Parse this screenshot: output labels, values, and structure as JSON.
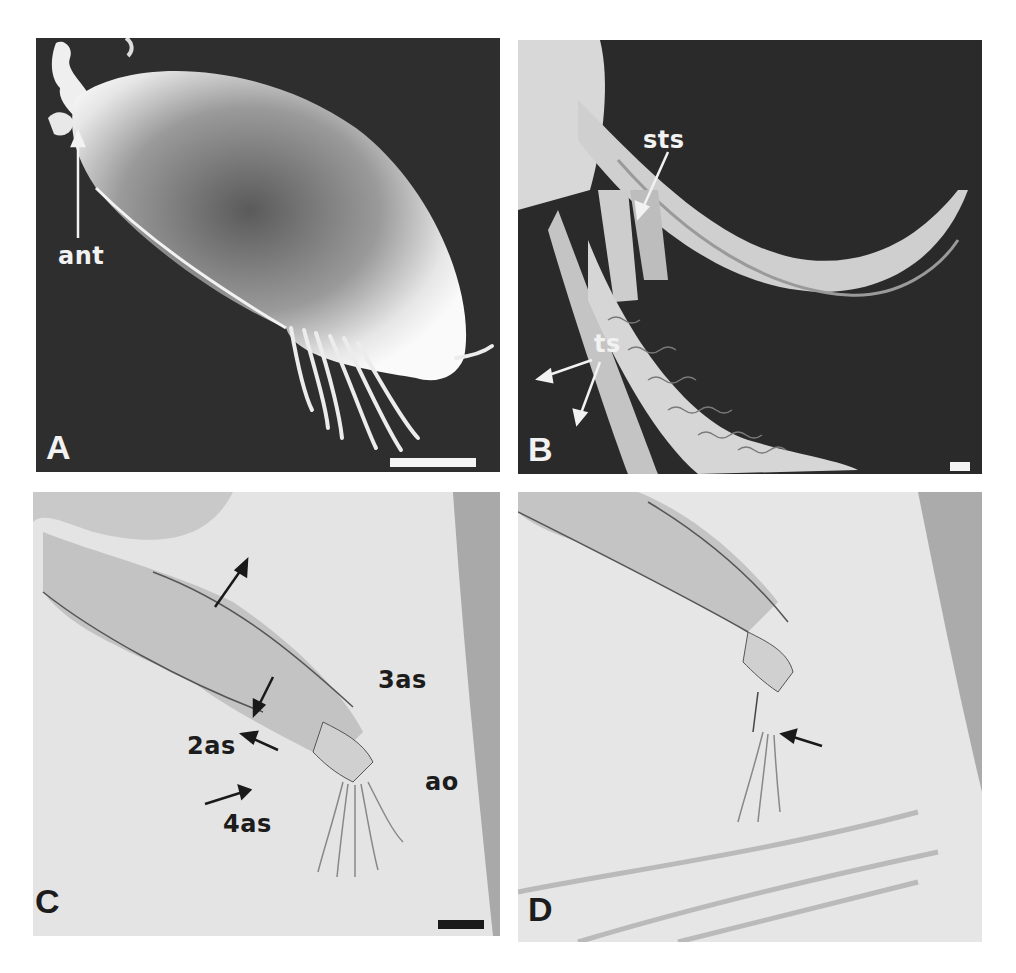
{
  "figure": {
    "panels": [
      {
        "id": "A",
        "label": "A",
        "type": "SEM micrograph",
        "background": "#2e2e2e",
        "annotations": [
          {
            "text": "ant"
          }
        ],
        "scale_bar": {
          "color": "#f4f4f4"
        }
      },
      {
        "id": "B",
        "label": "B",
        "type": "SEM micrograph",
        "background": "#2a2a2a",
        "annotations": [
          {
            "text": "sts"
          },
          {
            "text": "ts"
          }
        ],
        "scale_bar": {
          "color": "#f4f4f4"
        }
      },
      {
        "id": "C",
        "label": "C",
        "type": "light micrograph",
        "background": "#e4e4e4",
        "annotations": [
          {
            "text": "3as"
          },
          {
            "text": "2as"
          },
          {
            "text": "ao"
          },
          {
            "text": "4as"
          }
        ],
        "scale_bar": {
          "color": "#1a1a1a"
        }
      },
      {
        "id": "D",
        "label": "D",
        "type": "light micrograph",
        "background": "#e6e6e6",
        "annotations": [],
        "scale_bar": null
      }
    ]
  }
}
